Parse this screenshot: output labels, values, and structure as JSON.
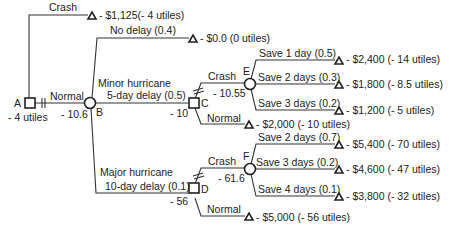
{
  "diagram": {
    "type": "decision-tree",
    "nodes": {
      "A": {
        "label": "A",
        "kind": "decision",
        "value": "- 4 utiles"
      },
      "B": {
        "label": "B",
        "kind": "chance",
        "value": "- 10.6"
      },
      "C": {
        "label": "C",
        "kind": "decision",
        "value": "- 10"
      },
      "D": {
        "label": "D",
        "kind": "decision",
        "value": "- 56"
      },
      "E": {
        "label": "E",
        "kind": "chance",
        "value": "- 10.55"
      },
      "F": {
        "label": "F",
        "kind": "chance",
        "value": "- 61.6"
      }
    },
    "branches": {
      "a_crash": "Crash",
      "a_normal": "Normal",
      "b_no_delay": "No delay (0.4)",
      "b_minor_1": "Minor hurricane",
      "b_minor_2": "5-day delay (0.5)",
      "b_major_1": "Major hurricane",
      "b_major_2": "10-day delay (0.1)",
      "c_crash": "Crash",
      "c_normal": "Normal",
      "d_crash": "Crash",
      "d_normal": "Normal",
      "e_save1": "Save 1 day (0.5)",
      "e_save2": "Save 2 days (0.3)",
      "e_save3": "Save 3 days (0.2)",
      "f_save2": "Save 2 days (0.7)",
      "f_save3": "Save 3 days (0.2)",
      "f_save4": "Save 4 days (0.1)"
    },
    "outcomes": {
      "a_crash": "- $1,125(- 4 utiles)",
      "b_no_delay": "- $0.0 (0 utiles)",
      "e_save1": "- $2,400 (- 14 utiles)",
      "e_save2": "- $1,800 (- 8.5 utiles)",
      "e_save3": "- $1,200 (- 5 utiles)",
      "c_normal": "- $2,000 (- 10 utiles)",
      "f_save2": "- $5,400 (- 70 utiles)",
      "f_save3": "- $4,600 (- 47 utiles)",
      "f_save4": "- $3,800 (- 32 utiles)",
      "d_normal": "- $5,000 (- 56 utiles)"
    }
  }
}
